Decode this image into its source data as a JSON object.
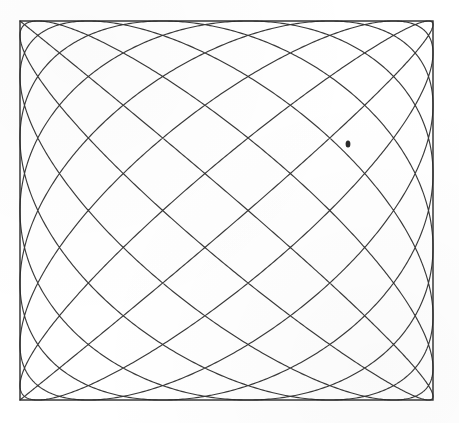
{
  "figure": {
    "kind": "lissajous-curve",
    "background_color": "#ffffff",
    "line_color": "#3a3a3a",
    "frame_color": "#2b2b2b",
    "frame": {
      "x": 20,
      "y": 21,
      "width": 413,
      "height": 379,
      "stroke_width": 1.4
    },
    "artifact": {
      "label": "ink-blot",
      "x": 348,
      "y": 144,
      "rx": 2.4,
      "ry": 3.6,
      "color": "#2a2a2a"
    }
  },
  "chart_data": {
    "type": "line",
    "subtitle": "",
    "xlabel": "",
    "ylabel": "",
    "grid": false,
    "legend_position": "none",
    "axis_visible": false,
    "xlim": [
      0,
      1
    ],
    "ylim": [
      0,
      1
    ],
    "parametric": {
      "equation_x": "x(t) = 0.5 - 0.5*cos(a*t)",
      "equation_y": "y(t) = 0.5 - 0.5*cos(b*t + phase)",
      "frequency_x": 16,
      "frequency_y": 15,
      "phase": 0,
      "t_min": 0,
      "t_max": 6.283185307179586,
      "samples": 9000,
      "description": "Closed Lissajous figure with near-equal frequencies producing a diamond lattice that is tangent to all four sides of the bounding rectangle and converges at the four corners.",
      "tangency_points_top": 16,
      "tangency_points_bottom": 16,
      "tangency_points_left": 15,
      "tangency_points_right": 15,
      "diamond_cells_horizontal": 16,
      "diamond_cells_vertical": 15
    },
    "series": [
      {
        "name": "trajectory",
        "color": "#3a3a3a",
        "stroke_width": 1.15,
        "closed": true
      }
    ]
  }
}
